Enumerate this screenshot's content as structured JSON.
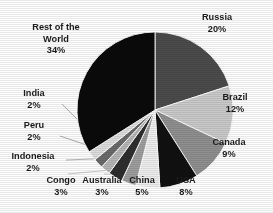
{
  "chart_data": {
    "type": "pie",
    "title": "",
    "subtitle": "",
    "xlabel": "",
    "ylabel": "",
    "legend_position": "none",
    "labels_position": "outside-with-leader-lines",
    "grid": false,
    "units": "percent",
    "categories": [
      "Russia",
      "Brazil",
      "Canada",
      "USA",
      "China",
      "Australia",
      "Congo",
      "Indonesia",
      "Peru",
      "India",
      "Rest of the World"
    ],
    "values": [
      20,
      12,
      9,
      8,
      5,
      3,
      3,
      2,
      2,
      2,
      34
    ],
    "slices": [
      {
        "name": "Russia",
        "value": 20,
        "value_label": "20%",
        "color": "#4b4b4b",
        "start_angle_deg": 0,
        "end_angle_deg": 72
      },
      {
        "name": "Brazil",
        "value": 12,
        "value_label": "12%",
        "color": "#c9c9c9",
        "start_angle_deg": 72,
        "end_angle_deg": 115.2
      },
      {
        "name": "Canada",
        "value": 9,
        "value_label": "9%",
        "color": "#8f8f8f",
        "start_angle_deg": 115.2,
        "end_angle_deg": 147.6
      },
      {
        "name": "USA",
        "value": 8,
        "value_label": "8%",
        "color": "#111111",
        "start_angle_deg": 147.6,
        "end_angle_deg": 176.4
      },
      {
        "name": "China",
        "value": 5,
        "value_label": "5%",
        "color": "#ededed",
        "start_angle_deg": 176.4,
        "end_angle_deg": 194.4
      },
      {
        "name": "Australia",
        "value": 3,
        "value_label": "3%",
        "color": "#9d9d9d",
        "start_angle_deg": 194.4,
        "end_angle_deg": 205.2
      },
      {
        "name": "Congo",
        "value": 3,
        "value_label": "3%",
        "color": "#2e2e2e",
        "start_angle_deg": 205.2,
        "end_angle_deg": 216
      },
      {
        "name": "Indonesia",
        "value": 2,
        "value_label": "2%",
        "color": "#b5b5b5",
        "start_angle_deg": 216,
        "end_angle_deg": 223.2
      },
      {
        "name": "Peru",
        "value": 2,
        "value_label": "2%",
        "color": "#6a6a6a",
        "start_angle_deg": 223.2,
        "end_angle_deg": 230.4
      },
      {
        "name": "India",
        "value": 2,
        "value_label": "2%",
        "color": "#dcdcdc",
        "start_angle_deg": 230.4,
        "end_angle_deg": 237.6
      },
      {
        "name": "Rest of the World",
        "value": 34,
        "value_label": "34%",
        "color": "#0a0a0a",
        "start_angle_deg": 237.6,
        "end_angle_deg": 360
      }
    ],
    "total": 100
  },
  "labels": {
    "russia": {
      "name": "Russia",
      "percent": "20%"
    },
    "brazil": {
      "name": "Brazil",
      "percent": "12%"
    },
    "canada": {
      "name": "Canada",
      "percent": "9%"
    },
    "usa": {
      "name": "USA",
      "percent": "8%"
    },
    "china": {
      "name": "China",
      "percent": "5%"
    },
    "australia": {
      "name": "Australia",
      "percent": "3%"
    },
    "congo": {
      "name": "Congo",
      "percent": "3%"
    },
    "indonesia": {
      "name": "Indonesia",
      "percent": "2%"
    },
    "peru": {
      "name": "Peru",
      "percent": "2%"
    },
    "india": {
      "name": "India",
      "percent": "2%"
    },
    "rest_of_world": {
      "name_line1": "Rest of the",
      "name_line2": "World",
      "percent": "34%"
    }
  },
  "colors": {
    "background": "#fdfdfd",
    "text": "#1b1b1b",
    "leader_line": "#9a9a9a",
    "slice_outline": "#ffffff"
  },
  "geometry": {
    "center_x": 155,
    "center_y": 110,
    "radius": 78
  }
}
